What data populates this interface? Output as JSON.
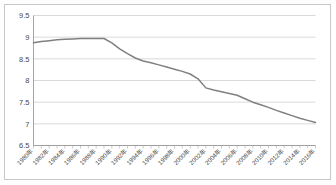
{
  "chart_data": {
    "type": "line",
    "title": "",
    "subtitle": "",
    "xlabel": "",
    "ylabel": "",
    "grid": true,
    "legend": "none",
    "line_color": "#808080",
    "grid_color": "#c9c9c9",
    "axis_color": "#9a9a9a",
    "ylim": [
      6.5,
      9.5
    ],
    "ytick_labels": [
      "6.5",
      "7",
      "7.5",
      "8",
      "8.5",
      "9",
      "9.5"
    ],
    "ytick_values": [
      6.5,
      7,
      7.5,
      8,
      8.5,
      9,
      9.5
    ],
    "xlim": [
      1980,
      2016
    ],
    "xtick_labels": [
      "1980年",
      "1982年",
      "1984年",
      "1986年",
      "1988年",
      "1990年",
      "1992年",
      "1994年",
      "1996年",
      "1998年",
      "2000年",
      "2002年",
      "2004年",
      "2006年",
      "2008年",
      "2010年",
      "2012年",
      "2014年",
      "2016年"
    ],
    "xtick_values": [
      1980,
      1982,
      1984,
      1986,
      1988,
      1990,
      1992,
      1994,
      1996,
      1998,
      2000,
      2002,
      2004,
      2006,
      2008,
      2010,
      2012,
      2014,
      2016
    ],
    "x": [
      1980,
      1981,
      1982,
      1983,
      1984,
      1985,
      1986,
      1987,
      1988,
      1989,
      1990,
      1991,
      1992,
      1993,
      1994,
      1995,
      1996,
      1997,
      1998,
      1999,
      2000,
      2001,
      2002,
      2003,
      2004,
      2005,
      2006,
      2007,
      2008,
      2009,
      2010,
      2011,
      2012,
      2013,
      2014,
      2015,
      2016
    ],
    "series": [
      {
        "name": "series-1",
        "values": [
          8.87,
          8.9,
          8.92,
          8.94,
          8.95,
          8.96,
          8.97,
          8.97,
          8.97,
          8.97,
          8.87,
          8.73,
          8.62,
          8.52,
          8.45,
          8.41,
          8.36,
          8.31,
          8.26,
          8.21,
          8.15,
          8.04,
          7.83,
          7.78,
          7.74,
          7.7,
          7.66,
          7.58,
          7.5,
          7.44,
          7.38,
          7.31,
          7.25,
          7.19,
          7.13,
          7.08,
          7.03
        ]
      }
    ]
  }
}
